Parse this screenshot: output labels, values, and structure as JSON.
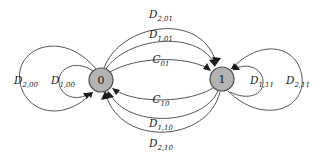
{
  "diagram": {
    "type": "state-transition-diagram",
    "background_color": "#ffffff",
    "edge_color": "#555555",
    "node_fill_color": "#b3b3b3",
    "node_stroke_color": "#4d4d4d",
    "label_color": "#1a1a1a",
    "nodes": [
      {
        "id": "state-0",
        "label": "0",
        "cx": 101,
        "cy": 80,
        "r": 12
      },
      {
        "id": "state-1",
        "label": "1",
        "cx": 222,
        "cy": 79,
        "r": 12
      }
    ],
    "edges": [
      {
        "id": "edge-d2-00",
        "base": "D",
        "sub": "2,00",
        "from": "0",
        "to": "0",
        "kind": "self-loop",
        "side": "left",
        "ring": "outer"
      },
      {
        "id": "edge-d1-00",
        "base": "D",
        "sub": "1,00",
        "from": "0",
        "to": "0",
        "kind": "self-loop",
        "side": "left",
        "ring": "inner"
      },
      {
        "id": "edge-d2-01",
        "base": "D",
        "sub": "2,01",
        "from": "0",
        "to": "1",
        "kind": "arc",
        "side": "top",
        "ring": "outer"
      },
      {
        "id": "edge-d1-01",
        "base": "D",
        "sub": "1,01",
        "from": "0",
        "to": "1",
        "kind": "arc",
        "side": "top",
        "ring": "middle"
      },
      {
        "id": "edge-c01",
        "base": "C",
        "sub": "01",
        "from": "0",
        "to": "1",
        "kind": "arc",
        "side": "top",
        "ring": "inner"
      },
      {
        "id": "edge-c10",
        "base": "C",
        "sub": "10",
        "from": "1",
        "to": "0",
        "kind": "arc",
        "side": "bottom",
        "ring": "inner"
      },
      {
        "id": "edge-d1-10",
        "base": "D",
        "sub": "1,10",
        "from": "1",
        "to": "0",
        "kind": "arc",
        "side": "bottom",
        "ring": "middle"
      },
      {
        "id": "edge-d2-10",
        "base": "D",
        "sub": "2,10",
        "from": "1",
        "to": "0",
        "kind": "arc",
        "side": "bottom",
        "ring": "outer"
      },
      {
        "id": "edge-d1-11",
        "base": "D",
        "sub": "1,11",
        "from": "1",
        "to": "1",
        "kind": "self-loop",
        "side": "right",
        "ring": "inner"
      },
      {
        "id": "edge-d2-11",
        "base": "D",
        "sub": "2,11",
        "from": "1",
        "to": "1",
        "kind": "self-loop",
        "side": "right",
        "ring": "outer"
      }
    ],
    "labels": {
      "d2_00": {
        "base": "D",
        "sub": "2,00",
        "x": 26,
        "y": 80
      },
      "d1_00": {
        "base": "D",
        "sub": "1,00",
        "x": 63,
        "y": 80
      },
      "d2_01": {
        "base": "D",
        "sub": "2,01",
        "x": 161,
        "y": 14
      },
      "d1_01": {
        "base": "D",
        "sub": "1,01",
        "x": 161,
        "y": 34
      },
      "c01": {
        "base": "C",
        "sub": "01",
        "x": 161,
        "y": 59
      },
      "c10": {
        "base": "C",
        "sub": "10",
        "x": 161,
        "y": 99
      },
      "d1_10": {
        "base": "D",
        "sub": "1,10",
        "x": 161,
        "y": 123
      },
      "d2_10": {
        "base": "D",
        "sub": "2,10",
        "x": 161,
        "y": 143
      },
      "d1_11": {
        "base": "D",
        "sub": "1,11",
        "x": 262,
        "y": 80
      },
      "d2_11": {
        "base": "D",
        "sub": "2,11",
        "x": 298,
        "y": 80
      }
    }
  }
}
